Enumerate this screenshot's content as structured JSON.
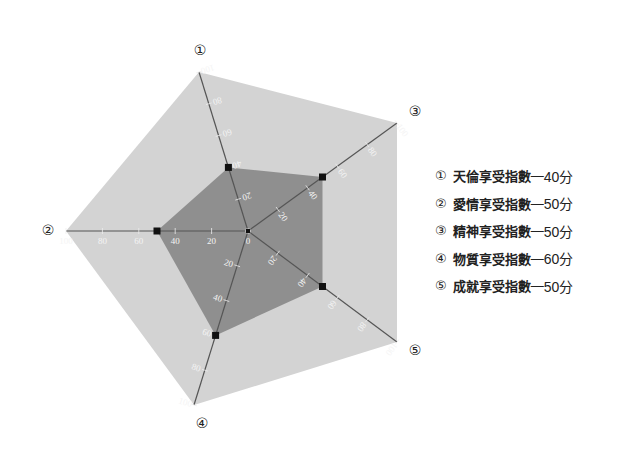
{
  "chart_data": {
    "type": "radar",
    "title": "",
    "axes": [
      {
        "id": "1",
        "marker": "①",
        "name": "天倫享受指數",
        "value": 40,
        "unit": "分"
      },
      {
        "id": "2",
        "marker": "②",
        "name": "愛情享受指數",
        "value": 50,
        "unit": "分"
      },
      {
        "id": "3",
        "marker": "③",
        "name": "精神享受指數",
        "value": 50,
        "unit": "分"
      },
      {
        "id": "4",
        "marker": "④",
        "name": "物質享受指數",
        "value": 60,
        "unit": "分"
      },
      {
        "id": "5",
        "marker": "⑤",
        "name": "成就享受指數",
        "value": 50,
        "unit": "分"
      }
    ],
    "range": [
      0,
      100
    ],
    "tick_values": [
      0,
      20,
      40,
      60,
      80,
      100
    ],
    "series": [
      {
        "name": "score",
        "values": [
          40,
          50,
          50,
          60,
          50
        ]
      }
    ],
    "legend_position": "right",
    "colors": {
      "outer_fill": "#d3d3d3",
      "inner_fill": "#8f8f8f",
      "marker": "#111111",
      "axis": "#555555"
    }
  },
  "legend": {
    "separator": "—",
    "items": [
      {
        "marker": "①",
        "name": "天倫享受指數",
        "value": "40分"
      },
      {
        "marker": "②",
        "name": "愛情享受指數",
        "value": "50分"
      },
      {
        "marker": "③",
        "name": "精神享受指數",
        "value": "50分"
      },
      {
        "marker": "④",
        "name": "物質享受指數",
        "value": "60分"
      },
      {
        "marker": "⑤",
        "name": "成就享受指數",
        "value": "50分"
      }
    ]
  }
}
